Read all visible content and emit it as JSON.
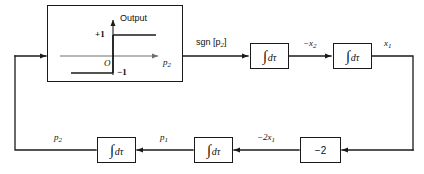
{
  "diagram": {
    "colors": {
      "line": "#1a1a1a",
      "axis": "#6e6e6e",
      "background": "#ffffff"
    },
    "signum_block": {
      "name": "signum nonlinearity",
      "axis_label_vertical": "Output",
      "axis_label_horizontal": "p",
      "axis_label_horizontal_sub": "2",
      "level_high": "+1",
      "level_low": "−1",
      "origin_label": "O"
    },
    "blocks": [
      {
        "id": "integrator-1",
        "label": "∫ dτ",
        "integral": "∫",
        "differential": "dτ"
      },
      {
        "id": "integrator-2",
        "label": "∫ dτ",
        "integral": "∫",
        "differential": "dτ"
      },
      {
        "id": "integrator-3",
        "label": "∫ dτ",
        "integral": "∫",
        "differential": "dτ"
      },
      {
        "id": "integrator-4",
        "label": "∫ dτ",
        "integral": "∫",
        "differential": "dτ"
      },
      {
        "id": "gain",
        "label": "−2"
      }
    ],
    "signals": {
      "sgn_p2": {
        "text": "sgn [p",
        "sub": "2",
        "tail": "]"
      },
      "minus_x2": {
        "text": "−x",
        "sub": "2"
      },
      "x1": {
        "text": "x",
        "sub": "1"
      },
      "minus_2x1": {
        "text": "−2x",
        "sub": "1"
      },
      "p1": {
        "text": "p",
        "sub": "1"
      },
      "p2": {
        "text": "p",
        "sub": "2"
      }
    }
  }
}
